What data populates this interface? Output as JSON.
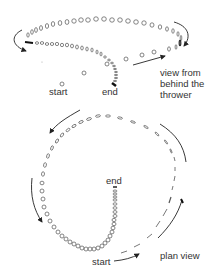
{
  "diagram": {
    "type": "motion-path-illustration",
    "colors": {
      "stroke": "#555555",
      "arrow": "#222222",
      "text": "#333333",
      "background": "#ffffff"
    },
    "top_view": {
      "name": "view from behind the thrower",
      "label_lines": [
        "view from",
        "behind the",
        "thrower"
      ],
      "start_label": "start",
      "end_label": "end"
    },
    "bottom_view": {
      "name": "plan view",
      "label": "plan view",
      "start_label": "start",
      "end_label": "end"
    }
  }
}
